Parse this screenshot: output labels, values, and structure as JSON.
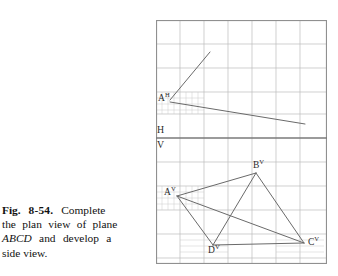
{
  "figure": {
    "caption_lines": [
      {
        "bold_prefix": "Fig.",
        "bold_number": "8-54.",
        "rest": "Complete"
      },
      {
        "text": "the plan view of plane"
      },
      {
        "italic": "ABCD",
        "rest": "and develop a"
      },
      {
        "text": "side view."
      }
    ],
    "caption_plain": "Fig. 8-54. Complete the plan view of plane ABCD and develop a side view."
  },
  "drawing": {
    "title": "Orthographic projection worksheet",
    "fold_line": {
      "upper_label": "H",
      "lower_label": "V",
      "y": 118
    },
    "grid": {
      "cell": 24,
      "cols": 7,
      "rows": 10,
      "line_color": "#b9b9b9",
      "border_color": "#8d8d8d",
      "subgrid_color": "#c9c9c9"
    },
    "line_color": "#6a6a6a",
    "top_view": {
      "name": "plan view (H)",
      "points": {
        "A": {
          "label": "A",
          "sup": "H",
          "x": 14,
          "y": 80
        },
        "ray_end": {
          "x": 54,
          "y": 32
        },
        "line_end": {
          "x": 149,
          "y": 104
        }
      }
    },
    "front_view": {
      "name": "front view (V)",
      "points": {
        "A": {
          "label": "A",
          "sup": "V",
          "x": 21,
          "y": 176
        },
        "B": {
          "label": "B",
          "sup": "V",
          "x": 100,
          "y": 153
        },
        "C": {
          "label": "C",
          "sup": "V",
          "x": 148,
          "y": 223
        },
        "D": {
          "label": "D",
          "sup": "V",
          "x": 57,
          "y": 225
        }
      },
      "edges": [
        "A-B",
        "B-C",
        "C-D",
        "D-A"
      ],
      "diagonals": [
        "A-C",
        "B-D"
      ]
    }
  }
}
